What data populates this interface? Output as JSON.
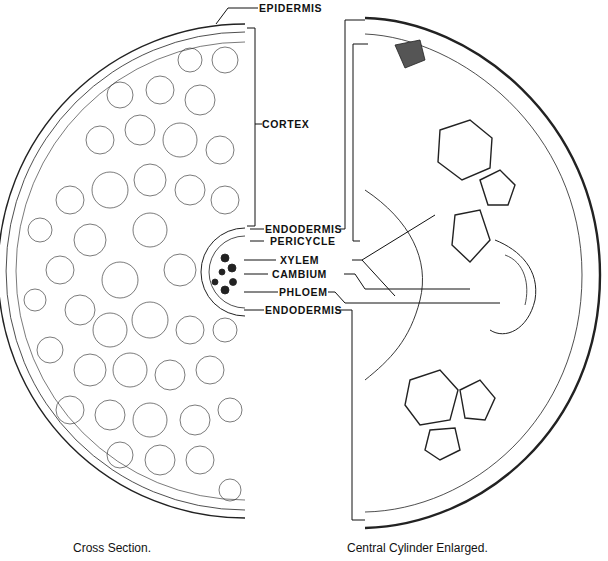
{
  "labels": {
    "epidermis": "EPIDERMIS",
    "cortex": "CORTEX",
    "endodermis_top": "ENDODERMIS",
    "pericycle": "PERICYCLE",
    "xylem": "XYLEM",
    "cambium": "CAMBIUM",
    "phloem": "PHLOEM",
    "endodermis_bottom": "ENDODERMIS"
  },
  "captions": {
    "left": "Cross Section.",
    "right": "Central Cylinder Enlarged."
  },
  "colors": {
    "ink": "#111111",
    "background": "#ffffff"
  }
}
